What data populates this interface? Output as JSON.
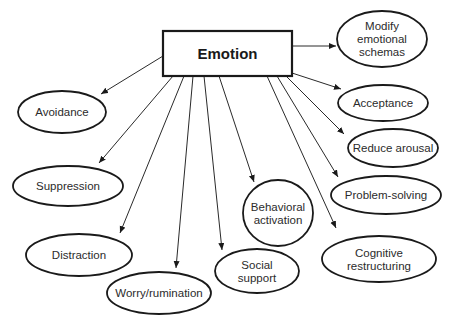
{
  "diagram": {
    "root": {
      "id": "emotion",
      "label": "Emotion",
      "x": 163,
      "y": 31,
      "w": 129,
      "h": 45
    },
    "nodes": [
      {
        "id": "modify-emotional-schemas",
        "lines": [
          "Modify",
          "emotional",
          "schemas"
        ],
        "cx": 382,
        "cy": 39,
        "rx": 45,
        "ry": 28,
        "from": [
          292,
          46
        ],
        "to": [
          336,
          46
        ]
      },
      {
        "id": "acceptance",
        "lines": [
          "Acceptance"
        ],
        "cx": 383,
        "cy": 103,
        "rx": 45,
        "ry": 18,
        "from": [
          292,
          73
        ],
        "to": [
          341,
          89
        ]
      },
      {
        "id": "reduce-arousal",
        "lines": [
          "Reduce arousal"
        ],
        "cx": 393,
        "cy": 148,
        "rx": 45,
        "ry": 19,
        "from": [
          286,
          76
        ],
        "to": [
          344,
          134
        ]
      },
      {
        "id": "problem-solving",
        "lines": [
          "Problem-solving"
        ],
        "cx": 386,
        "cy": 195,
        "rx": 55,
        "ry": 19,
        "from": [
          277,
          76
        ],
        "to": [
          338,
          177
        ]
      },
      {
        "id": "cognitive-restructuring",
        "lines": [
          "Cognitive",
          "restructuring"
        ],
        "cx": 379,
        "cy": 259,
        "rx": 57,
        "ry": 23,
        "from": [
          267,
          76
        ],
        "to": [
          336,
          228
        ]
      },
      {
        "id": "behavioral-activation",
        "lines": [
          "Behavioral",
          "activation"
        ],
        "cx": 278,
        "cy": 213,
        "rx": 35,
        "ry": 33,
        "from": [
          219,
          76
        ],
        "to": [
          254,
          182
        ]
      },
      {
        "id": "social-support",
        "lines": [
          "Social",
          "support"
        ],
        "cx": 257,
        "cy": 271,
        "rx": 42,
        "ry": 22,
        "from": [
          204,
          76
        ],
        "to": [
          222,
          250
        ]
      },
      {
        "id": "worry-rumination",
        "lines": [
          "Worry/rumination"
        ],
        "cx": 159,
        "cy": 293,
        "rx": 52,
        "ry": 21,
        "from": [
          193,
          76
        ],
        "to": [
          176,
          268
        ]
      },
      {
        "id": "distraction",
        "lines": [
          "Distraction"
        ],
        "cx": 79,
        "cy": 255,
        "rx": 53,
        "ry": 21,
        "from": [
          184,
          76
        ],
        "to": [
          120,
          233
        ]
      },
      {
        "id": "suppression",
        "lines": [
          "Suppression"
        ],
        "cx": 68,
        "cy": 186,
        "rx": 55,
        "ry": 20,
        "from": [
          173,
          76
        ],
        "to": [
          99,
          163
        ]
      },
      {
        "id": "avoidance",
        "lines": [
          "Avoidance"
        ],
        "cx": 62,
        "cy": 112,
        "rx": 44,
        "ry": 21,
        "from": [
          163,
          56
        ],
        "to": [
          101,
          94
        ]
      }
    ],
    "colors": {
      "stroke": "#1a1a1a",
      "text": "#2b2b2b",
      "background": "#ffffff"
    }
  }
}
